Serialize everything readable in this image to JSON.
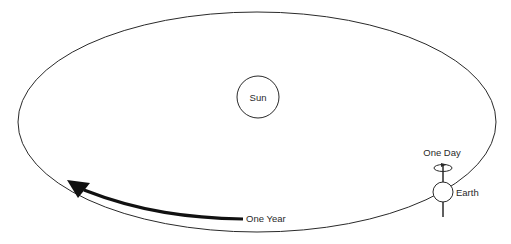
{
  "diagram": {
    "type": "orbit-diagram",
    "colors": {
      "background": "#ffffff",
      "stroke": "#2a2a2a",
      "arrow": "#111111",
      "text": "#2a2a2a"
    },
    "orbit": {
      "cx": 257,
      "cy": 122,
      "rx": 239,
      "ry": 110
    },
    "sun": {
      "label": "Sun",
      "cx": 258,
      "cy": 97,
      "r": 21
    },
    "earth": {
      "label": "Earth",
      "cx": 443,
      "cy": 192,
      "r": 10
    },
    "rotation": {
      "label": "One Day"
    },
    "revolution": {
      "label": "One Year"
    }
  }
}
